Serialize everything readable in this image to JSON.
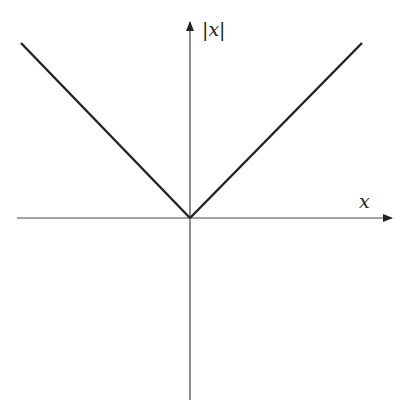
{
  "diagram": {
    "function": "y = |x|",
    "axes": {
      "x_label": "x",
      "y_label": "|x|",
      "x_axis": {
        "x1": 17,
        "x2": 392,
        "y": 218
      },
      "y_axis": {
        "x": 190,
        "y1": 22,
        "y2": 400
      }
    },
    "origin": {
      "x": 190,
      "y": 218
    },
    "lines": [
      {
        "name": "left-branch",
        "x1": 21,
        "y1": 43,
        "x2": 190,
        "y2": 218
      },
      {
        "name": "right-branch",
        "x1": 190,
        "y1": 218,
        "x2": 362,
        "y2": 43
      }
    ],
    "colors": {
      "axis": "#444444",
      "curve": "#222222",
      "background": "#ffffff"
    }
  }
}
